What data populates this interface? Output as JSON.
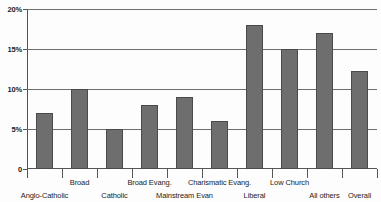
{
  "chart_data": {
    "type": "bar",
    "title": "",
    "subtitle": "",
    "xlabel": "",
    "ylabel": "",
    "ylim": [
      0,
      20
    ],
    "grid": true,
    "legend": "none",
    "y_ticks": [
      {
        "value": 20,
        "label": "20%"
      },
      {
        "value": 15,
        "label": "15%"
      },
      {
        "value": 10,
        "label": "10%"
      },
      {
        "value": 5,
        "label": "5%"
      },
      {
        "value": 0,
        "label": "0"
      }
    ],
    "categories": [
      "Anglo-Catholic",
      "Broad",
      "Catholic",
      "Broad Evang.",
      "Mainstream Evan",
      "Charismatic Evang.",
      "Liberal",
      "Low Church",
      "All others",
      "Overall"
    ],
    "category_label_rows": [
      "bottom",
      "top",
      "bottom",
      "top",
      "bottom",
      "top",
      "bottom",
      "top",
      "bottom",
      "bottom"
    ],
    "values": [
      7,
      10,
      5,
      8,
      9,
      6,
      18,
      15,
      17,
      12.3
    ],
    "bar_color": "#6e6e6e",
    "bar_border_color": "#4a4a4a",
    "gridline_color": "#6f6f6f",
    "axis_color": "#555555",
    "background_color": "#fdfdfd"
  }
}
